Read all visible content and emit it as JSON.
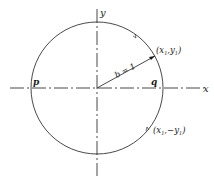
{
  "diagram": {
    "type": "unit-circle",
    "axes": {
      "x_label": "x",
      "y_label": "y"
    },
    "points": {
      "p": "p",
      "q": "q",
      "upper": {
        "label_open": "(",
        "x": "x",
        "x_sub": "1",
        "sep": ",",
        "y": "y",
        "y_sub": "1",
        "label_close": ")"
      },
      "lower": {
        "label_open": "(",
        "x": "x",
        "x_sub": "1",
        "sep": ",−",
        "y": "y",
        "y_sub": "1",
        "label_close": ")"
      }
    },
    "radius_label": "b = 1",
    "colors": {
      "ink": "#1a1a1a",
      "background": "#ffffff"
    }
  }
}
